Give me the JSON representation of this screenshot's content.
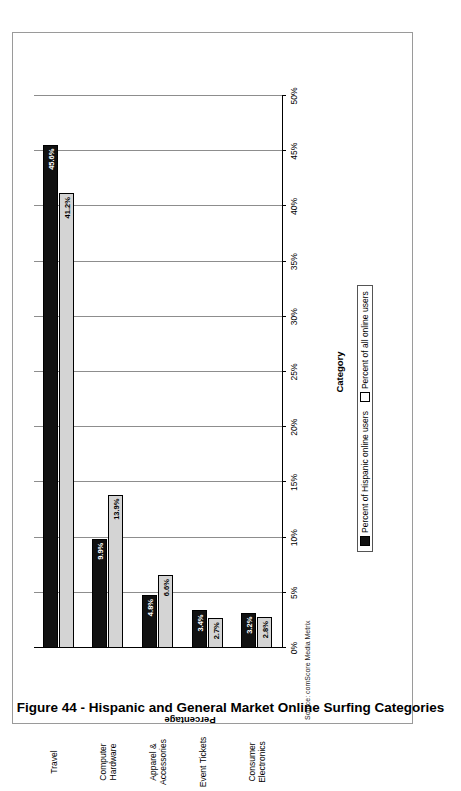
{
  "caption": "Figure 44 - Hispanic and General Market Online Surfing Categories",
  "source_note": "Source: comScore Media Metrix",
  "legend": {
    "series_1": "Percent of Hispanic online users",
    "series_2": "Percent of all online users"
  },
  "axes": {
    "y_title": "Percentage",
    "x_title": "Category"
  },
  "colors": {
    "series_1": "#111111",
    "series_2": "#d4d4d4",
    "gridline": "#8d8d8d",
    "axis": "#000000",
    "page": "#ffffff"
  },
  "chart_data": {
    "type": "bar",
    "orientation": "vertical",
    "title": "Figure 44 - Hispanic and General Market Online Surfing Categories",
    "xlabel": "Category",
    "ylabel": "Percentage",
    "ylim": [
      0,
      50
    ],
    "ytick_labels": [
      "0%",
      "5%",
      "10%",
      "15%",
      "20%",
      "25%",
      "30%",
      "35%",
      "40%",
      "45%",
      "50%"
    ],
    "ytick_values": [
      0,
      5,
      10,
      15,
      20,
      25,
      30,
      35,
      40,
      45,
      50
    ],
    "grid": true,
    "legend_position": "bottom",
    "categories": [
      "Travel",
      "Computer Hardware",
      "Apparel & Accessories",
      "Event Tickets",
      "Consumer Electronics"
    ],
    "series": [
      {
        "name": "Percent of Hispanic online users",
        "color": "#111111",
        "values": [
          45.6,
          9.9,
          4.8,
          3.4,
          3.2
        ],
        "labels": [
          "45.6%",
          "9.9%",
          "4.8%",
          "3.4%",
          "3.2%"
        ]
      },
      {
        "name": "Percent of all online users",
        "color": "#d4d4d4",
        "values": [
          41.2,
          13.9,
          6.6,
          2.7,
          2.8
        ],
        "labels": [
          "41.2%",
          "13.9%",
          "6.6%",
          "2.7%",
          "2.8%"
        ]
      }
    ]
  }
}
